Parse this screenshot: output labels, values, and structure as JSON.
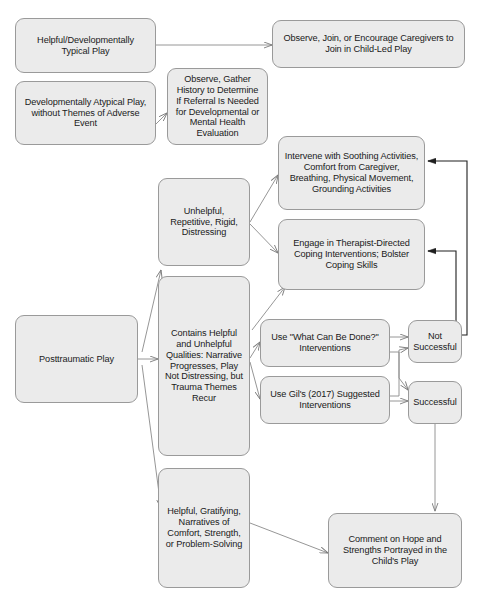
{
  "diagram": {
    "canvas": {
      "width": 478,
      "height": 601
    },
    "style": {
      "node_fill": "#ebebeb",
      "node_border": "#9a9a9a",
      "edge_color": "#8a8a8a",
      "text_color": "#1a1a1a",
      "background": "#ffffff"
    },
    "nodes": [
      {
        "id": "helpful-typical-play",
        "label": "Helpful/Developmentally\nTypical Play",
        "x": 15,
        "y": 18,
        "w": 141,
        "h": 55,
        "font_size": 9.2
      },
      {
        "id": "observe-join-encourage",
        "label": "Observe, Join, or Encourage Caregivers to\nJoin in Child-Led Play",
        "x": 272,
        "y": 20,
        "w": 193,
        "h": 48,
        "font_size": 9.2
      },
      {
        "id": "atypical-play",
        "label": "Developmentally Atypical Play,\nwithout Themes of Adverse\nEvent",
        "x": 15,
        "y": 81,
        "w": 141,
        "h": 64,
        "font_size": 9.2
      },
      {
        "id": "observe-gather-history",
        "label": "Observe, Gather\nHistory to Determine\nIf Referral Is Needed\nfor Developmental or\nMental Health\nEvaluation",
        "x": 167,
        "y": 68,
        "w": 101,
        "h": 77,
        "font_size": 9.2
      },
      {
        "id": "unhelpful-repetitive",
        "label": "Unhelpful,\nRepetitive, Rigid,\nDistressing",
        "x": 158,
        "y": 178,
        "w": 92,
        "h": 88,
        "font_size": 9.2
      },
      {
        "id": "intervene-soothing",
        "label": "Intervene with Soothing Activities,\nComfort from Caregiver,\nBreathing, Physical Movement,\nGrounding Activities",
        "x": 278,
        "y": 136,
        "w": 147,
        "h": 74,
        "font_size": 9.2
      },
      {
        "id": "engage-therapist-directed",
        "label": "Engage in Therapist-Directed\nCoping Interventions; Bolster\nCoping Skills",
        "x": 278,
        "y": 219,
        "w": 147,
        "h": 71,
        "font_size": 9.2
      },
      {
        "id": "posttraumatic-play",
        "label": "Posttraumatic Play",
        "x": 15,
        "y": 315,
        "w": 123,
        "h": 88,
        "font_size": 9.2
      },
      {
        "id": "contains-helpful-unhelpful",
        "label": "Contains Helpful\nand Unhelpful\nQualities: Narrative\nProgresses, Play\nNot Distressing, but\nTrauma Themes\nRecur",
        "x": 158,
        "y": 276,
        "w": 92,
        "h": 180,
        "font_size": 9.2
      },
      {
        "id": "use-what-can-be-done",
        "label": "Use \"What Can Be Done?\"\nInterventions",
        "x": 260,
        "y": 319,
        "w": 130,
        "h": 48,
        "font_size": 9.2
      },
      {
        "id": "use-gil-interventions",
        "label": "Use Gil's (2017) Suggested\nInterventions",
        "x": 260,
        "y": 376,
        "w": 130,
        "h": 48,
        "font_size": 9.2
      },
      {
        "id": "not-successful",
        "label": "Not\nSuccessful",
        "x": 408,
        "y": 320,
        "w": 54,
        "h": 43,
        "font_size": 9.2
      },
      {
        "id": "successful",
        "label": "Successful",
        "x": 408,
        "y": 381,
        "w": 54,
        "h": 43,
        "font_size": 9.2
      },
      {
        "id": "helpful-gratifying",
        "label": "Helpful, Gratifying,\nNarratives of\nComfort, Strength,\nor Problem-Solving",
        "x": 158,
        "y": 468,
        "w": 92,
        "h": 120,
        "font_size": 9.2
      },
      {
        "id": "comment-on-hope",
        "label": "Comment on Hope and\nStrengths Portrayed in the\nChild's Play",
        "x": 328,
        "y": 513,
        "w": 134,
        "h": 75,
        "font_size": 9.2
      }
    ],
    "edges": [
      {
        "id": "edge-typical-to-observe-join",
        "from": "helpful-typical-play",
        "to": "observe-join-encourage"
      },
      {
        "id": "edge-atypical-to-gather-history",
        "from": "atypical-play",
        "to": "observe-gather-history"
      },
      {
        "id": "edge-unhelpful-to-intervene",
        "from": "unhelpful-repetitive",
        "to": "intervene-soothing"
      },
      {
        "id": "edge-unhelpful-to-engage",
        "from": "unhelpful-repetitive",
        "to": "engage-therapist-directed"
      },
      {
        "id": "edge-ptplay-to-unhelpful",
        "from": "posttraumatic-play",
        "to": "unhelpful-repetitive"
      },
      {
        "id": "edge-ptplay-to-contains",
        "from": "posttraumatic-play",
        "to": "contains-helpful-unhelpful"
      },
      {
        "id": "edge-ptplay-to-gratifying",
        "from": "posttraumatic-play",
        "to": "helpful-gratifying"
      },
      {
        "id": "edge-contains-to-engage",
        "from": "contains-helpful-unhelpful",
        "to": "engage-therapist-directed"
      },
      {
        "id": "edge-contains-to-what-can-be-done",
        "from": "contains-helpful-unhelpful",
        "to": "use-what-can-be-done"
      },
      {
        "id": "edge-contains-to-gil",
        "from": "contains-helpful-unhelpful",
        "to": "use-gil-interventions"
      },
      {
        "id": "edge-what-can-be-done-to-not-successful",
        "from": "use-what-can-be-done",
        "to": "not-successful"
      },
      {
        "id": "edge-what-can-be-done-to-successful",
        "from": "use-what-can-be-done",
        "to": "successful"
      },
      {
        "id": "edge-gil-to-not-successful",
        "from": "use-gil-interventions",
        "to": "not-successful"
      },
      {
        "id": "edge-gil-to-successful",
        "from": "use-gil-interventions",
        "to": "successful"
      },
      {
        "id": "edge-not-successful-to-intervene",
        "from": "not-successful",
        "to": "intervene-soothing"
      },
      {
        "id": "edge-not-successful-to-engage",
        "from": "not-successful",
        "to": "engage-therapist-directed"
      },
      {
        "id": "edge-successful-to-comment",
        "from": "successful",
        "to": "comment-on-hope"
      },
      {
        "id": "edge-gratifying-to-comment",
        "from": "helpful-gratifying",
        "to": "comment-on-hope"
      }
    ]
  }
}
